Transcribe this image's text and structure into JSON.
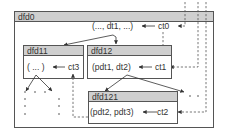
{
  "diagram": {
    "type": "nested data flow diagram",
    "boxes": {
      "dfd0": {
        "title": "dfd0",
        "content": "(..., dt1, ...)",
        "control": "ct0"
      },
      "dfd11": {
        "title": "dfd11",
        "content": "( ... )",
        "control": "ct3"
      },
      "dfd12": {
        "title": "dfd12",
        "content": "(pdt1, dt2)",
        "control": "ct1"
      },
      "dfd121": {
        "title": "dfd121",
        "content": "(pdt2, pdt3)",
        "control": "ct2"
      }
    },
    "colors": {
      "header_fill": "#cfcfcf",
      "border": "#555555",
      "text": "#333333",
      "background": "#ffffff"
    },
    "edges": [
      {
        "from": "ct0",
        "to": "(..., dt1, ...)",
        "style": "solid"
      },
      {
        "from": "(..., dt1, ...)",
        "to": "dfd11",
        "style": "solid"
      },
      {
        "from": "(..., dt1, ...)",
        "to": "dfd12",
        "style": "solid"
      },
      {
        "from": "ct0",
        "to": "ct1",
        "style": "dashed"
      },
      {
        "from": "ct1",
        "to": "(pdt1, dt2)",
        "style": "solid"
      },
      {
        "from": "ct3",
        "to": "( ... )",
        "style": "solid"
      },
      {
        "from": "ct2",
        "to": "(pdt2, pdt3)",
        "style": "solid"
      },
      {
        "from": "(pdt1, dt2)",
        "to": "dfd121",
        "style": "solid"
      },
      {
        "from": "(pdt1, dt2)",
        "to": "...",
        "style": "solid"
      },
      {
        "from": "( ... )",
        "to": "...",
        "style": "solid"
      },
      {
        "from": "external",
        "to": "ct0",
        "style": "dashed"
      },
      {
        "from": "external",
        "to": "ct1",
        "style": "dashed"
      },
      {
        "from": "external",
        "to": "ct2",
        "style": "dashed"
      },
      {
        "from": "dfd121",
        "to": "ct3",
        "style": "dashed"
      }
    ]
  }
}
